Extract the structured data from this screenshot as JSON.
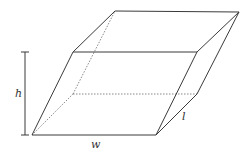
{
  "figure": {
    "type": "parallelepiped",
    "labels": {
      "height": "h",
      "width": "w",
      "length": "l"
    },
    "colors": {
      "edge": "#3a3a3a",
      "hidden_edge": "#6a6a6a",
      "background": "#ffffff"
    }
  }
}
